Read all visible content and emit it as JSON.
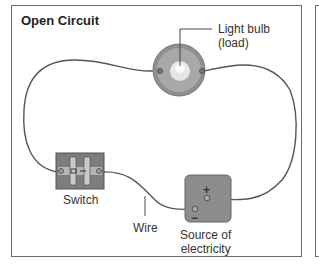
{
  "title": "Open Circuit",
  "labels": {
    "bulb_line1": "Light bulb",
    "bulb_line2": "(load)",
    "switch": "Switch",
    "wire": "Wire",
    "source_line1": "Source of",
    "source_line2": "electricity"
  },
  "terminals": {
    "plus": "+",
    "minus": "−"
  },
  "colors": {
    "wire": "#555555",
    "bulb_outer": "#9a9a9a",
    "bulb_inner": "#e8e8e8",
    "switch_base": "#7a7a7a",
    "battery": "#8d8d8d",
    "border": "#6a6a6a"
  }
}
